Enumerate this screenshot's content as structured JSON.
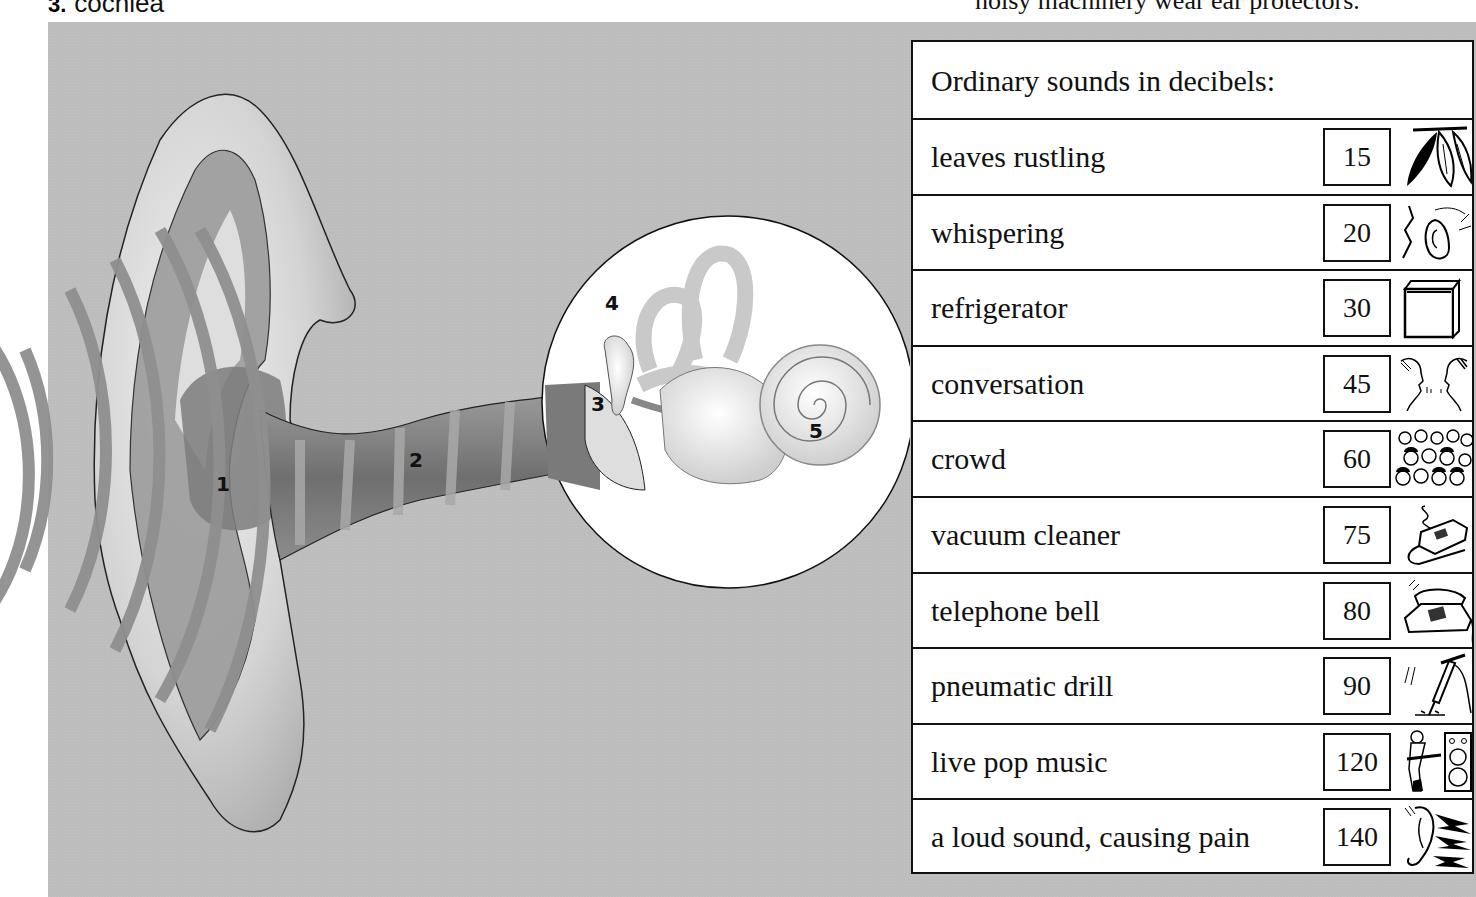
{
  "top_strip": {
    "left_number": "3.",
    "left_text": "cochlea",
    "middle_text": "Exam Chart The loud Table the Ear",
    "right_text": "noisy machinery wear ear protectors."
  },
  "illustration": {
    "title": "Diagram of the human ear",
    "labels": [
      {
        "id": "1",
        "text": "1"
      },
      {
        "id": "2",
        "text": "2"
      },
      {
        "id": "3",
        "text": "3"
      },
      {
        "id": "4",
        "text": "4"
      },
      {
        "id": "5",
        "text": "5"
      }
    ],
    "colors": {
      "background": "#bdbdbd",
      "waves": "#8f8f8f",
      "ear_light": "#e8e8e8",
      "ear_dark": "#8a8a8a",
      "inset_circle": "#ffffff"
    }
  },
  "table": {
    "title": "Ordinary sounds in decibels:",
    "rows": [
      {
        "label": "leaves rustling",
        "db": "15",
        "icon": "leaves-icon"
      },
      {
        "label": "whispering",
        "db": "20",
        "icon": "whisper-ear-icon"
      },
      {
        "label": "refrigerator",
        "db": "30",
        "icon": "refrigerator-icon"
      },
      {
        "label": "conversation",
        "db": "45",
        "icon": "conversation-faces-icon"
      },
      {
        "label": "crowd",
        "db": "60",
        "icon": "crowd-icon"
      },
      {
        "label": "vacuum cleaner",
        "db": "75",
        "icon": "vacuum-cleaner-icon"
      },
      {
        "label": "telephone bell",
        "db": "80",
        "icon": "telephone-icon"
      },
      {
        "label": "pneumatic drill",
        "db": "90",
        "icon": "pneumatic-drill-icon"
      },
      {
        "label": "live pop music",
        "db": "120",
        "icon": "guitarist-speaker-icon"
      },
      {
        "label": "a loud sound, causing pain",
        "db": "140",
        "icon": "ear-pain-lightning-icon"
      }
    ]
  }
}
